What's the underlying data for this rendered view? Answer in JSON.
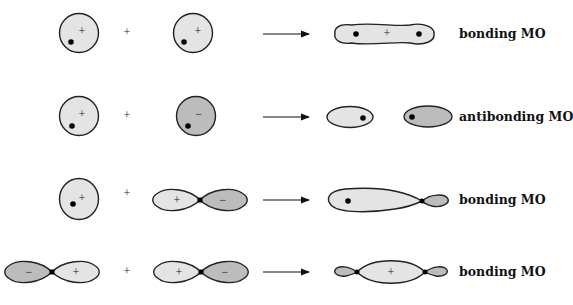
{
  "colors": {
    "positive_fill": "#e4e4e4",
    "negative_fill": "#bcbcbc",
    "outline": "#222222",
    "nucleus": "#000000"
  },
  "operators": {
    "plus": "+",
    "arrow": "→"
  },
  "rows": [
    {
      "left": {
        "type": "s-orbital",
        "phase": "+"
      },
      "right": {
        "type": "s-orbital",
        "phase": "+"
      },
      "result": {
        "shape": "bonding-s-s",
        "phases": [
          "+"
        ]
      },
      "label": "bonding MO"
    },
    {
      "left": {
        "type": "s-orbital",
        "phase": "+"
      },
      "right": {
        "type": "s-orbital",
        "phase": "−"
      },
      "result": {
        "shape": "antibonding-s-s",
        "phases": [
          "+",
          "−"
        ]
      },
      "label": "antibonding MO"
    },
    {
      "left": {
        "type": "s-orbital",
        "phase": "+"
      },
      "right": {
        "type": "p-orbital",
        "phases": [
          "+",
          "−"
        ]
      },
      "result": {
        "shape": "bonding-s-p",
        "phases": [
          "+",
          "−"
        ]
      },
      "label": "bonding MO"
    },
    {
      "left": {
        "type": "p-orbital",
        "phases": [
          "−",
          "+"
        ]
      },
      "right": {
        "type": "p-orbital",
        "phases": [
          "+",
          "−"
        ]
      },
      "result": {
        "shape": "bonding-p-p",
        "phases": [
          "−",
          "+",
          "−"
        ]
      },
      "label": "bonding MO"
    }
  ]
}
